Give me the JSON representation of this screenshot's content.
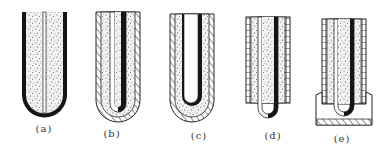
{
  "figure": {
    "panels": [
      {
        "id": "a",
        "label": "(a)",
        "label_x": 44,
        "label_y": 123
      },
      {
        "id": "b",
        "label": "(b)",
        "label_x": 112,
        "label_y": 128
      },
      {
        "id": "c",
        "label": "(c)",
        "label_x": 199,
        "label_y": 130
      },
      {
        "id": "d",
        "label": "(d)",
        "label_x": 273,
        "label_y": 130
      },
      {
        "id": "e",
        "label": "(e)",
        "label_x": 342,
        "label_y": 133
      }
    ]
  },
  "colors": {
    "ink": "#151515",
    "paper": "#ffffff",
    "speckle": "#5a5a5a",
    "label": "#333333"
  }
}
